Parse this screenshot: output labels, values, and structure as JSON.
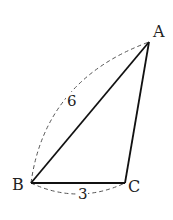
{
  "diagram": {
    "type": "triangle",
    "vertices": {
      "A": {
        "label": "A",
        "x": 149,
        "y": 42
      },
      "B": {
        "label": "B",
        "x": 31,
        "y": 183
      },
      "C": {
        "label": "C",
        "x": 125,
        "y": 183
      }
    },
    "measurements": {
      "AB": "6",
      "BC": "3"
    },
    "colors": {
      "stroke": "#111111",
      "dashed": "#555555"
    }
  }
}
